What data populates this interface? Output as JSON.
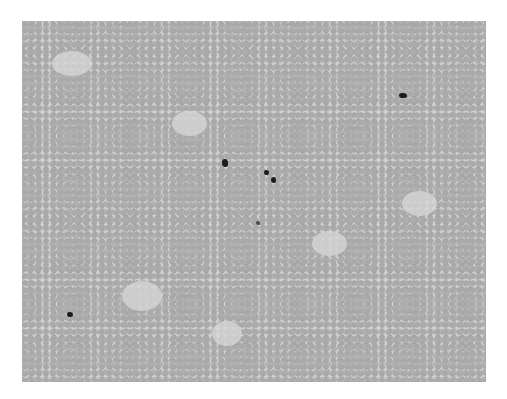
{
  "image": {
    "description": "Light-microscopy blood smear: dense field of grey erythrocytes with a few dark-stained leukocyte/platelet clusters",
    "palette": {
      "background": "#ffffff",
      "field": "#cfcfcf",
      "cells": "#a9a9a9",
      "dark_cells": "#1c1c1c"
    },
    "dark_features": [
      {
        "x": 401,
        "y": 95,
        "w": 8,
        "h": 5
      },
      {
        "x": 224,
        "y": 161,
        "w": 6,
        "h": 8
      },
      {
        "x": 266,
        "y": 171,
        "w": 5,
        "h": 5
      },
      {
        "x": 272,
        "y": 178,
        "w": 5,
        "h": 6
      },
      {
        "x": 257,
        "y": 222,
        "w": 4,
        "h": 4
      },
      {
        "x": 68,
        "y": 313,
        "w": 6,
        "h": 5
      }
    ]
  }
}
